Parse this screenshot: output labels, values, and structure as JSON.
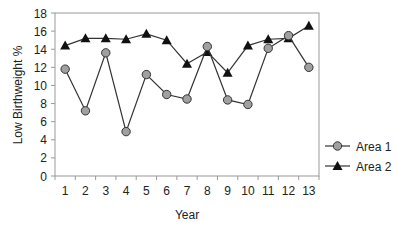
{
  "chart_data": {
    "type": "line",
    "title": "",
    "xlabel": "Year",
    "ylabel": "Low Birthweight %",
    "ylim": [
      0,
      18
    ],
    "yticks": [
      0,
      2,
      4,
      6,
      8,
      10,
      12,
      14,
      16,
      18
    ],
    "categories": [
      "1",
      "2",
      "3",
      "4",
      "5",
      "6",
      "7",
      "8",
      "9",
      "10",
      "11",
      "12",
      "13"
    ],
    "grid": false,
    "legend_position": "right",
    "series": [
      {
        "name": "Area 1",
        "marker": "circle",
        "color": "#a0a0a0",
        "values": [
          11.8,
          7.2,
          13.6,
          4.9,
          11.2,
          9.0,
          8.5,
          14.3,
          8.4,
          7.9,
          14.1,
          15.5,
          12.0
        ]
      },
      {
        "name": "Area 2",
        "marker": "triangle",
        "color": "#111111",
        "values": [
          14.4,
          15.2,
          15.2,
          15.1,
          15.7,
          15.0,
          12.4,
          13.7,
          11.4,
          14.4,
          15.1,
          15.2,
          16.6
        ]
      }
    ]
  }
}
